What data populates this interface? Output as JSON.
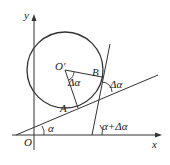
{
  "diagram": {
    "type": "geometry",
    "axes": {
      "x_label": "x",
      "y_label": "y",
      "origin_label": "O"
    },
    "points": {
      "center": "O'",
      "tangent_point_1": "A",
      "tangent_point_2": "B"
    },
    "angles": {
      "central_angle": "Δα",
      "angle_between_tangents": "Δα",
      "line1_angle": "α",
      "line2_angle": "α+Δα"
    }
  }
}
